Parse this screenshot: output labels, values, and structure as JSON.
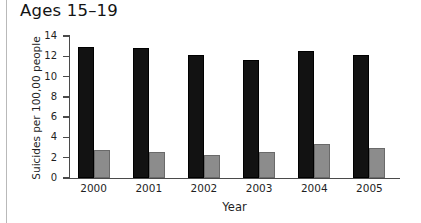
{
  "chart_data": {
    "type": "bar",
    "title": "Ages 15–19",
    "xlabel": "Year",
    "ylabel": "Suicides per 100,00 people",
    "categories": [
      "2000",
      "2001",
      "2002",
      "2003",
      "2004",
      "2005"
    ],
    "series": [
      {
        "name": "series-1",
        "color": "#121212",
        "values": [
          12.9,
          12.8,
          12.1,
          11.6,
          12.5,
          12.1
        ]
      },
      {
        "name": "series-2",
        "color": "#8c8c8c",
        "values": [
          2.8,
          2.6,
          2.3,
          2.6,
          3.4,
          3.0
        ]
      }
    ],
    "ylim": [
      0,
      14
    ],
    "yticks": [
      0,
      2,
      4,
      6,
      8,
      10,
      12,
      14
    ],
    "yticklabels": [
      "0",
      "2",
      "4",
      "6",
      "8",
      "10",
      "12",
      "14"
    ],
    "grid": false,
    "legend": "none"
  },
  "colors": {
    "series_black": "#121212",
    "series_gray": "#8c8c8c",
    "axis": "#4a4a4a",
    "frame_rule": "#b9b9b9",
    "text": "#1f1f1f"
  }
}
